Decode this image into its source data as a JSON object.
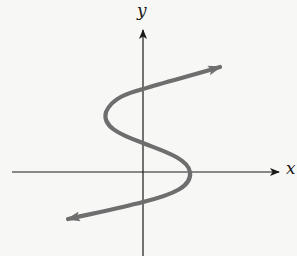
{
  "diagram": {
    "type": "cartesian-graph",
    "axes": {
      "x_label": "x",
      "y_label": "y"
    },
    "colors": {
      "background": "#f7f7f5",
      "axis": "#1a1a1a",
      "curve": "#6e6e6e"
    },
    "curve": {
      "shape": "S-shaped (sideways cubic, x as function of y)",
      "start_arrow": "down-left",
      "end_arrow": "up-right",
      "y_axis_crossings": 3,
      "x_axis_crossings": 1
    }
  }
}
